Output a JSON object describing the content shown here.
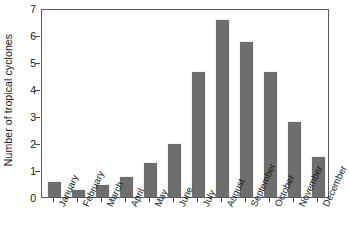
{
  "chart_data": {
    "type": "bar",
    "title": "",
    "subtitle": "",
    "xlabel": "",
    "ylabel": "Number of tropical cyclones",
    "categories": [
      "January",
      "February",
      "March",
      "April",
      "May",
      "June",
      "July",
      "August",
      "September",
      "October",
      "November",
      "December"
    ],
    "values": [
      0.6,
      0.28,
      0.5,
      0.78,
      1.28,
      2.0,
      4.68,
      6.6,
      5.78,
      4.67,
      2.83,
      1.52
    ],
    "series": [
      {
        "name": "Number of tropical cyclones",
        "values": [
          0.6,
          0.28,
          0.5,
          0.78,
          1.28,
          2.0,
          4.68,
          6.6,
          5.78,
          4.67,
          2.83,
          1.52
        ]
      }
    ],
    "ylim": [
      0,
      7
    ],
    "ytick_labels": [
      "0",
      "1",
      "2",
      "3",
      "4",
      "5",
      "6",
      "7"
    ],
    "ytick_values": [
      0,
      1,
      2,
      3,
      4,
      5,
      6,
      7
    ],
    "grid": false,
    "legend": false,
    "legend_position": "none",
    "bar_color": "#6e6e6e",
    "axis_color": "#5b5b5b",
    "background_color": "#ffffff",
    "xtick_label_rotation": -65
  }
}
